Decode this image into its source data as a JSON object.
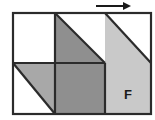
{
  "figure": {
    "canvas": {
      "width": 155,
      "height": 120
    },
    "grid": {
      "left": 13,
      "top": 13,
      "right": 151,
      "bottom": 114,
      "columns_x": [
        13,
        55,
        105,
        151
      ],
      "rows_y": [
        13,
        63,
        114
      ],
      "stroke_color": "#2b2b2b",
      "stroke_width": 2.2
    },
    "palette": {
      "white": "#ffffff",
      "light_gray": "#c9c9c9",
      "medium_gray": "#a8a8a8",
      "dark_gray": "#8f8f8f",
      "outline": "#2b2b2b",
      "text": "#1a1a1a",
      "background": "#ffffff"
    },
    "cells": [
      {
        "name": "top-left-cell",
        "row": 0,
        "column": 0,
        "fill_type": "empty",
        "fill": "#ffffff",
        "description": "unshaded square"
      },
      {
        "name": "top-middle-cell",
        "row": 0,
        "column": 1,
        "fill_type": "triangle-lower-left",
        "fill": "#8f8f8f",
        "description": "dark gray triangle occupying lower-left half"
      },
      {
        "name": "bottom-left-cell",
        "row": 1,
        "column": 0,
        "fill_type": "triangle-upper-right",
        "fill": "#a8a8a8",
        "description": "medium gray triangle occupying upper-right half"
      },
      {
        "name": "bottom-middle-cell",
        "row": 1,
        "column": 1,
        "fill_type": "solid",
        "fill": "#8f8f8f",
        "description": "fully shaded square"
      },
      {
        "name": "right-region",
        "row": "0-1",
        "column": 2,
        "fill_type": "triangle-with-base",
        "fill": "#c9c9c9",
        "description": "light gray shape spanning both rows; diagonal from top-left corner down to right edge at mid height"
      }
    ],
    "labels": [
      {
        "name": "region-label-f",
        "text": "F",
        "x": 128,
        "y": 99,
        "bold": true
      }
    ],
    "arrow": {
      "name": "direction-arrow",
      "direction": "right",
      "x_start": 96,
      "x_end": 131,
      "y": 6,
      "color": "#1a1a1a",
      "stroke_width": 2
    }
  }
}
